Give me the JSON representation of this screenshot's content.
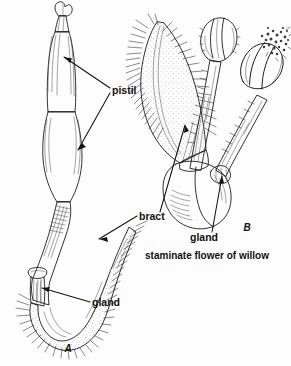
{
  "figure": {
    "title": "staminate flower of willow",
    "background_color": "#fdfdfd",
    "ink_color": "#1b1b1b",
    "panels": [
      {
        "id": "A",
        "letter": "A",
        "subject": "pistillate flower of willow",
        "letter_x": 68,
        "letter_y": 352
      },
      {
        "id": "B",
        "letter": "B",
        "subject": "staminate flower of willow",
        "letter_x": 247,
        "letter_y": 231
      }
    ],
    "caption": {
      "text": "staminate flower of willow",
      "x": 207,
      "y": 259
    },
    "labels": [
      {
        "name": "pistil",
        "text": "pistil",
        "x": 112,
        "y": 91,
        "anchor": "start",
        "panel": "A"
      },
      {
        "name": "bract",
        "text": "bract",
        "x": 139,
        "y": 218,
        "anchor": "start",
        "panel": "A+B"
      },
      {
        "name": "gland-a",
        "text": "gland",
        "x": 92,
        "y": 306,
        "anchor": "start",
        "panel": "A"
      },
      {
        "name": "gland-b",
        "text": "gland",
        "x": 190,
        "y": 241,
        "anchor": "start",
        "panel": "B"
      }
    ],
    "colors": {
      "ovary_fill": "#a9a9a9",
      "style_fill": "#9a9a9a",
      "bract_a_fill": "#b4b4b4",
      "bract_b_fill": "#d2d2d2",
      "anther_fill": "#a6a6a6",
      "filament_fill": "#9e9e9e",
      "gland_fill": "#bdbdbd",
      "receptacle_fill": "#c4c4c4",
      "outline": "#1b1b1b",
      "text": "#111111"
    }
  }
}
